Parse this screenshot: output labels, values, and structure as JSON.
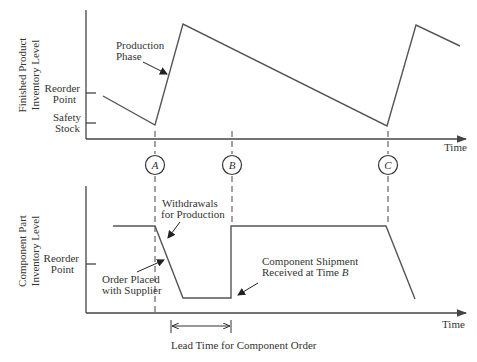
{
  "top_chart": {
    "y_axis_label_line1": "Finished Product",
    "y_axis_label_line2": "Inventory Level",
    "x_axis_label": "Time",
    "reorder_point_line1": "Reorder",
    "reorder_point_line2": "Point",
    "safety_stock_line1": "Safety",
    "safety_stock_line2": "Stock",
    "annotation_line1": "Production",
    "annotation_line2": "Phase"
  },
  "time_markers": [
    "A",
    "B",
    "C"
  ],
  "bottom_chart": {
    "y_axis_label_line1": "Component Part",
    "y_axis_label_line2": "Inventory Level",
    "x_axis_label": "Time",
    "reorder_point_line1": "Reorder",
    "reorder_point_line2": "Point",
    "withdrawals_line1": "Withdrawals",
    "withdrawals_line2": "for Production",
    "order_placed_line1": "Order Placed",
    "order_placed_line2": "with Supplier",
    "shipment_line1": "Component Shipment",
    "shipment_line2_prefix": "Received at Time ",
    "shipment_line2_var": "B",
    "lead_time_label": "Lead Time for Component Order"
  }
}
